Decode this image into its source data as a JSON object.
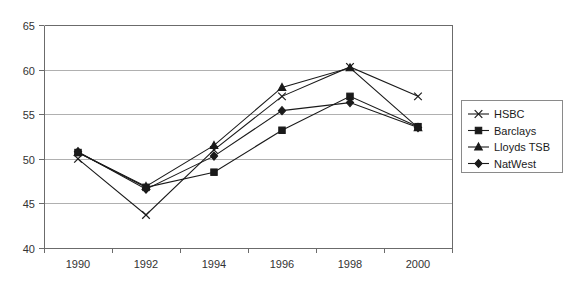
{
  "chart_data": {
    "type": "line",
    "title": "",
    "xlabel": "",
    "ylabel": "",
    "categories": [
      "1990",
      "1992",
      "1994",
      "1996",
      "1998",
      "2000"
    ],
    "ylim": [
      40,
      65
    ],
    "yticks": [
      "40",
      "45",
      "50",
      "55",
      "60",
      "65"
    ],
    "grid": true,
    "legend_position": "right",
    "series": [
      {
        "name": "HSBC",
        "marker": "cross",
        "values": [
          50.0,
          43.7,
          51.0,
          57.0,
          60.3,
          57.0
        ]
      },
      {
        "name": "Barclays",
        "marker": "square",
        "values": [
          50.7,
          46.8,
          48.5,
          53.2,
          57.0,
          53.6
        ]
      },
      {
        "name": "Lloyds TSB",
        "marker": "triangle",
        "values": [
          50.7,
          46.9,
          51.5,
          58.0,
          60.2,
          53.5
        ]
      },
      {
        "name": "NatWest",
        "marker": "diamond",
        "values": [
          50.8,
          46.6,
          50.3,
          55.4,
          56.3,
          53.5
        ]
      }
    ]
  },
  "legend": {
    "entries": [
      {
        "label": "HSBC"
      },
      {
        "label": "Barclays"
      },
      {
        "label": "Lloyds TSB"
      },
      {
        "label": "NatWest"
      }
    ]
  }
}
